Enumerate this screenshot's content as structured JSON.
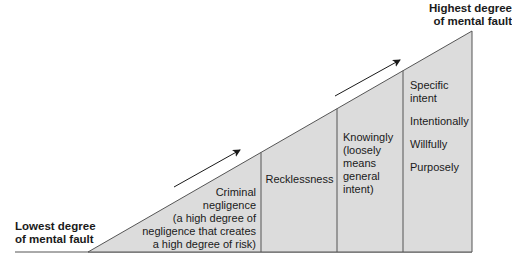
{
  "diagram": {
    "top_label_line1": "Highest degree",
    "top_label_line2": "of mental fault",
    "bottom_label_line1": "Lowest degree",
    "bottom_label_line2": "of mental fault",
    "sections": [
      {
        "lines": [
          "Criminal",
          "negligence",
          "(a high degree of",
          "negligence that creates",
          "a high degree of risk)"
        ]
      },
      {
        "lines": [
          "Recklessness"
        ]
      },
      {
        "lines": [
          "Knowingly",
          "(loosely",
          "means",
          "general",
          "intent)"
        ]
      },
      {
        "lines": [
          "Specific",
          "intent",
          "",
          "Intentionally",
          "",
          "Willfully",
          "",
          "Purposely"
        ]
      }
    ],
    "colors": {
      "fill": "#dcdcdc",
      "stroke": "#555555",
      "text": "#1a1a1a"
    }
  }
}
